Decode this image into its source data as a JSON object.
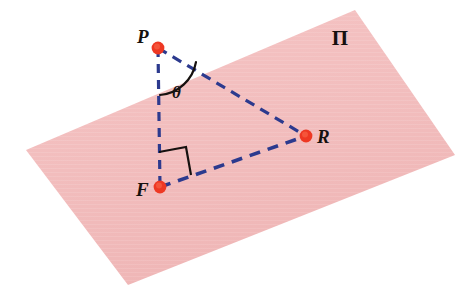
{
  "figure": {
    "type": "geometry-diagram",
    "width": 470,
    "height": 298,
    "background_color": "#ffffff"
  },
  "colors": {
    "plane_fill": "#f3bfbf",
    "plane_fill_shade": "#efb6b6",
    "line_blue": "#2c3a8e",
    "point_red": "#ee3823",
    "point_red_core": "#f5543a",
    "ink_black": "#16110f"
  },
  "plane": {
    "name": "plane-pi",
    "label": "Π",
    "label_x": 340,
    "label_y": 45,
    "corners": [
      {
        "x": 26,
        "y": 150
      },
      {
        "x": 355,
        "y": 10
      },
      {
        "x": 455,
        "y": 155
      },
      {
        "x": 128,
        "y": 285
      }
    ],
    "polygon_points": "26,150 355,10 455,155 128,285"
  },
  "points": [
    {
      "id": "P",
      "label": "P",
      "x": 158,
      "y": 48,
      "radius": 6,
      "label_x": 137,
      "label_y": 43,
      "description": "external point above the plane"
    },
    {
      "id": "F",
      "label": "F",
      "x": 160,
      "y": 187,
      "radius": 6,
      "label_x": 136,
      "label_y": 196,
      "description": "foot of the perpendicular in the plane"
    },
    {
      "id": "R",
      "label": "R",
      "x": 306,
      "y": 136,
      "radius": 6,
      "label_x": 317,
      "label_y": 143,
      "description": "point in the plane"
    }
  ],
  "segments": [
    {
      "id": "PF",
      "name": "segment-p-f",
      "from": "P",
      "to": "R",
      "x1": 158,
      "y1": 48,
      "x2": 160,
      "y2": 187,
      "style": "dashed",
      "dash": "9 7",
      "width": 3.2
    },
    {
      "id": "PR",
      "name": "segment-p-r",
      "from": "P",
      "to": "R",
      "x1": 158,
      "y1": 48,
      "x2": 306,
      "y2": 136,
      "style": "dashed",
      "dash": "10 7",
      "width": 3.2
    },
    {
      "id": "FR",
      "name": "segment-f-r",
      "from": "F",
      "to": "R",
      "x1": 160,
      "y1": 187,
      "x2": 306,
      "y2": 136,
      "style": "dashed",
      "dash": "11 8",
      "width": 3.6
    }
  ],
  "angle_mark": {
    "name": "angle-theta",
    "label": "θ",
    "at_vertex": "P",
    "label_x": 172,
    "label_y": 98,
    "arc_path": "M 160 95 A 40 40 0 0 0 196 62",
    "stroke_width": 2.2
  },
  "right_angle_mark": {
    "name": "right-angle-at-f",
    "at_vertex": "F",
    "value": "90°",
    "path": "M 159 152 L 186 147 L 191 175",
    "stroke_width": 2.2
  },
  "legend": {
    "caption": "P is joined to F and R; PF is perpendicular to the plane Π; θ is the angle FPR."
  }
}
